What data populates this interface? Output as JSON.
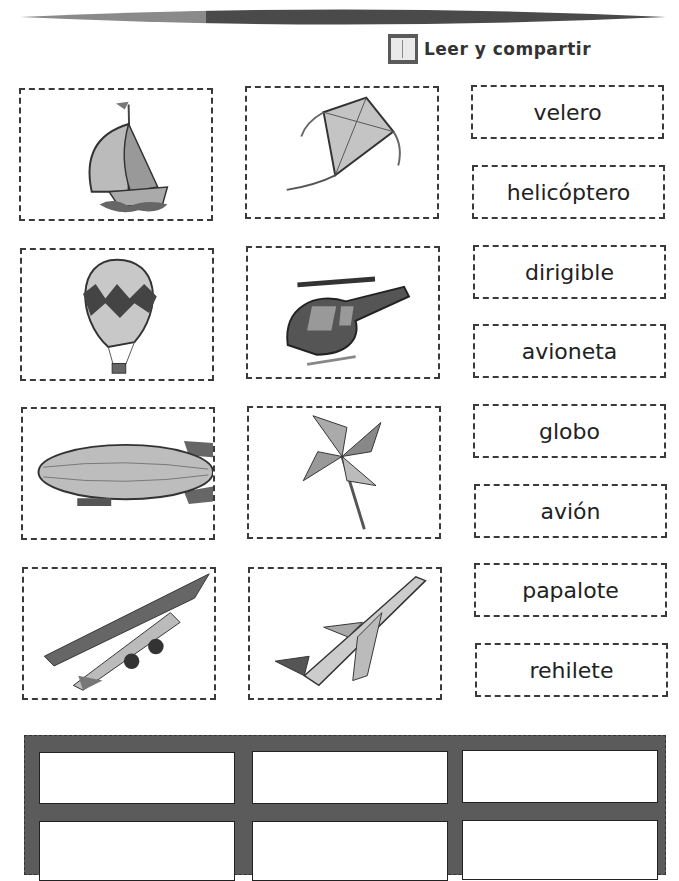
{
  "header": {
    "title": "Leer y compartir",
    "icon": "book-icon"
  },
  "picture_cards": [
    {
      "id": "sailboat",
      "icon": "sailboat-icon"
    },
    {
      "id": "kite",
      "icon": "kite-icon"
    },
    {
      "id": "hot-air-balloon",
      "icon": "hot-air-balloon-icon"
    },
    {
      "id": "helicopter",
      "icon": "helicopter-icon"
    },
    {
      "id": "blimp",
      "icon": "blimp-icon"
    },
    {
      "id": "pinwheel",
      "icon": "pinwheel-icon"
    },
    {
      "id": "small-plane",
      "icon": "small-plane-icon"
    },
    {
      "id": "jet-airplane",
      "icon": "airplane-icon"
    }
  ],
  "word_cards": [
    "velero",
    "helicóptero",
    "dirigible",
    "avioneta",
    "globo",
    "avión",
    "papalote",
    "rehilete"
  ],
  "answer_grid": {
    "rows": 2,
    "columns": 3,
    "slots": [
      "",
      "",
      "",
      "",
      "",
      ""
    ]
  },
  "colors": {
    "frame": "#5b5b5b",
    "dashed_border": "#3a3a3a",
    "bar_light": "#8a8a8a",
    "bar_dark": "#4a4a4a"
  }
}
